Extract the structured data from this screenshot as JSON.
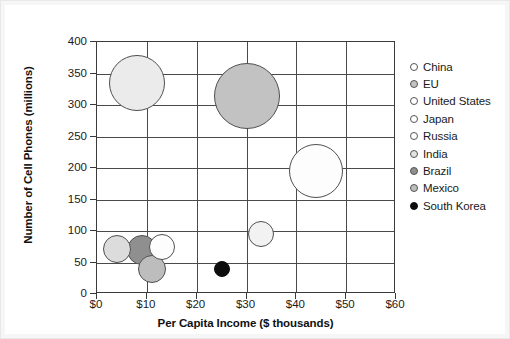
{
  "chart_data": {
    "type": "scatter",
    "title": "",
    "xlabel": "Per Capita Income ($ thousands)",
    "ylabel": "Number of Cell Phones (millions)",
    "xlim": [
      0,
      60
    ],
    "ylim": [
      0,
      400
    ],
    "xticks": [
      "$0",
      "$10",
      "$20",
      "$30",
      "$40",
      "$50",
      "$60"
    ],
    "xtick_values": [
      0,
      10,
      20,
      30,
      40,
      50,
      60
    ],
    "yticks": [
      "0",
      "50",
      "100",
      "150",
      "200",
      "250",
      "300",
      "350",
      "400"
    ],
    "ytick_values": [
      0,
      50,
      100,
      150,
      200,
      250,
      300,
      350,
      400
    ],
    "grid": true,
    "legend_position": "right",
    "bubble_note": "Bubble area encodes population",
    "points": [
      {
        "name": "China",
        "x": 8,
        "y": 335,
        "r": 28,
        "color": "#ebebeb",
        "stroke": "#4f4f4f"
      },
      {
        "name": "EU",
        "x": 30,
        "y": 315,
        "r": 33,
        "color": "#c2c2c2",
        "stroke": "#4f4f4f"
      },
      {
        "name": "United States",
        "x": 44,
        "y": 195,
        "r": 27,
        "color": "#fdfdfd",
        "stroke": "#4f4f4f"
      },
      {
        "name": "Japan",
        "x": 33,
        "y": 95,
        "r": 13,
        "color": "#f2f2f2",
        "stroke": "#4f4f4f"
      },
      {
        "name": "Russia",
        "x": 13,
        "y": 75,
        "r": 13,
        "color": "#fdfdfd",
        "stroke": "#4f4f4f"
      },
      {
        "name": "India",
        "x": 4,
        "y": 72,
        "r": 14,
        "color": "#dcdcdc",
        "stroke": "#4f4f4f"
      },
      {
        "name": "Brazil",
        "x": 9,
        "y": 70,
        "r": 15,
        "color": "#8f8f8f",
        "stroke": "#4f4f4f"
      },
      {
        "name": "Mexico",
        "x": 11,
        "y": 40,
        "r": 14,
        "color": "#bdbdbd",
        "stroke": "#4f4f4f"
      },
      {
        "name": "South Korea",
        "x": 25,
        "y": 40,
        "r": 8,
        "color": "#0d0d0d",
        "stroke": "#0d0d0d"
      }
    ]
  },
  "legend": {
    "items": [
      {
        "label": "China",
        "color": "#ffffff"
      },
      {
        "label": "EU",
        "color": "#c2c2c2"
      },
      {
        "label": "United States",
        "color": "#ffffff"
      },
      {
        "label": "Japan",
        "color": "#ffffff"
      },
      {
        "label": "Russia",
        "color": "#ffffff"
      },
      {
        "label": "India",
        "color": "#e2e2e2"
      },
      {
        "label": "Brazil",
        "color": "#8f8f8f"
      },
      {
        "label": "Mexico",
        "color": "#bdbdbd"
      },
      {
        "label": "South Korea",
        "color": "#0d0d0d"
      }
    ]
  }
}
